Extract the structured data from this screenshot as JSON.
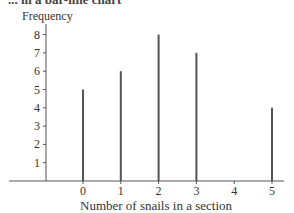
{
  "caption": "... in a bar-line chart",
  "chart_data": {
    "type": "bar",
    "style": "bar-line",
    "title": "",
    "xlabel": "Number of snails in a section",
    "ylabel": "Frequency",
    "categories": [
      "0",
      "1",
      "2",
      "3",
      "4",
      "5"
    ],
    "values": [
      5,
      6,
      8,
      7,
      0,
      4
    ],
    "x_ticks": [
      "0",
      "1",
      "2",
      "3",
      "4",
      "5"
    ],
    "y_ticks": [
      "1",
      "2",
      "3",
      "4",
      "5",
      "6",
      "7",
      "8"
    ],
    "ylim": [
      0,
      8
    ],
    "grid": false,
    "legend": null,
    "bar_color": "#555555"
  }
}
